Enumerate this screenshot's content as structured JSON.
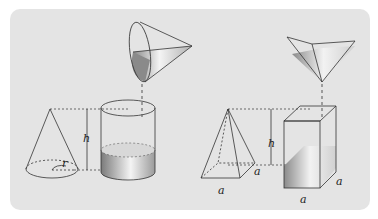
{
  "diagram": {
    "left": {
      "solid": "cone",
      "container": "cylinder",
      "labels": {
        "height": "h",
        "radius": "r"
      }
    },
    "right": {
      "solid": "square pyramid",
      "container": "square prism",
      "labels": {
        "height": "h",
        "base_side_1": "a",
        "base_side_2": "a",
        "prism_side_1": "a",
        "prism_side_2": "a"
      }
    },
    "colors": {
      "background": "#e4e4e4",
      "stroke": "#333333",
      "fill_dark": "#8a8a8a",
      "fill_light": "#f2f2f2"
    }
  }
}
